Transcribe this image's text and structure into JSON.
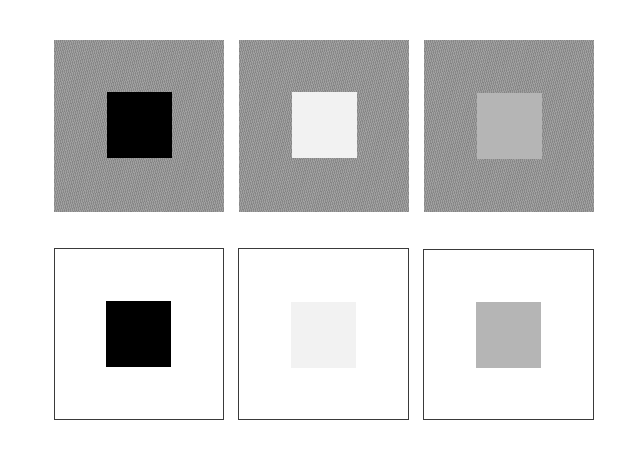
{
  "figure": {
    "colors": {
      "textured_surround": "#9a9a9a",
      "white_surround": "#ffffff",
      "outline": "#3a3a3a",
      "target_black": "#000000",
      "target_light": "#f2f2f2",
      "target_mid": "#b5b5b5"
    },
    "rows": [
      {
        "name": "top-row",
        "surround": "textured-gray",
        "panels": [
          {
            "x": 54,
            "y": 40,
            "w": 170,
            "h": 172,
            "target": "black",
            "target_color": "#000000",
            "tx": 53,
            "ty": 52
          },
          {
            "x": 239,
            "y": 40,
            "w": 170,
            "h": 172,
            "target": "light",
            "target_color": "#f2f2f2",
            "tx": 53,
            "ty": 52
          },
          {
            "x": 424,
            "y": 40,
            "w": 170,
            "h": 172,
            "target": "mid-gray",
            "target_color": "#b5b5b5",
            "tx": 53,
            "ty": 53
          }
        ]
      },
      {
        "name": "bottom-row",
        "surround": "white-outlined",
        "panels": [
          {
            "x": 54,
            "y": 248,
            "w": 170,
            "h": 172,
            "target": "black",
            "target_color": "#000000",
            "tx": 52,
            "ty": 53
          },
          {
            "x": 238,
            "y": 248,
            "w": 171,
            "h": 172,
            "target": "light",
            "target_color": "#f2f2f2",
            "tx": 53,
            "ty": 54
          },
          {
            "x": 423,
            "y": 249,
            "w": 171,
            "h": 171,
            "target": "mid-gray",
            "target_color": "#b5b5b5",
            "tx": 53,
            "ty": 53
          }
        ]
      }
    ]
  }
}
